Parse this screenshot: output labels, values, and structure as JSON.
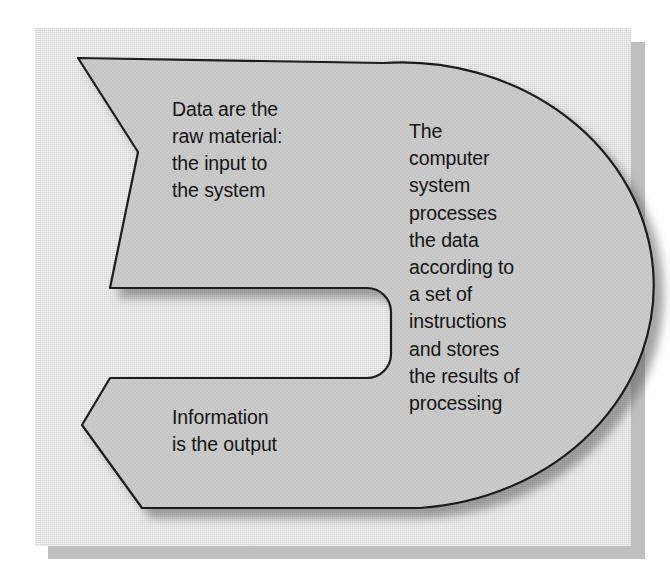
{
  "diagram": {
    "shape_label": "c-shaped-process-arrow",
    "colors": {
      "shape_fill": "#c8c8c8",
      "shape_outline": "#1a1a1a",
      "panel_background": "#dcdcdc",
      "panel_shadow": "#b5b5b5",
      "page_background": "#ffffff",
      "text": "#141414"
    },
    "blocks": {
      "input": {
        "name": "input-stage",
        "text": "Data are the\nraw material:\nthe input to\nthe system"
      },
      "process": {
        "name": "processing-stage",
        "text": "The\ncomputer\nsystem\nprocesses\nthe data\naccording to\na set of\ninstructions\nand stores\nthe results of\nprocessing"
      },
      "output": {
        "name": "output-stage",
        "text": "Information\nis the output"
      }
    }
  }
}
